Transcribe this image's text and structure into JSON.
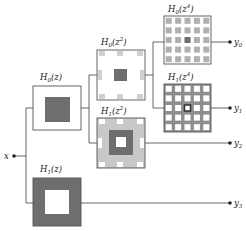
{
  "diagram": {
    "type": "wavelet packet filter bank tree",
    "input": {
      "label": "x"
    },
    "filters": [
      {
        "id": "h0z",
        "base": "H",
        "sub": "0",
        "arg": "z",
        "exp": "",
        "label": "H0(z)",
        "pattern": "white box, dark center square"
      },
      {
        "id": "h1z",
        "base": "H",
        "sub": "1",
        "arg": "z",
        "exp": "",
        "label": "H1(z)",
        "pattern": "dark box, white center square"
      },
      {
        "id": "h0z2",
        "base": "H",
        "sub": "0",
        "arg": "z",
        "exp": "2",
        "label": "H0(z^2)",
        "pattern": "white box, dark center, light gray edge tiles"
      },
      {
        "id": "h1z2",
        "base": "H",
        "sub": "1",
        "arg": "z",
        "exp": "2",
        "label": "H1(z^2)",
        "pattern": "light gray box, dark ring, white center"
      },
      {
        "id": "h0z4",
        "base": "H",
        "sub": "0",
        "arg": "z",
        "exp": "4",
        "label": "H0(z^4)",
        "pattern": "white box, grid of gray dots, dark center dot"
      },
      {
        "id": "h1z4",
        "base": "H",
        "sub": "1",
        "arg": "z",
        "exp": "4",
        "label": "H1(z^4)",
        "pattern": "gray box, grid of white holes, outlined center"
      }
    ],
    "outputs": [
      {
        "base": "y",
        "sub": "0",
        "label": "y0"
      },
      {
        "base": "y",
        "sub": "1",
        "label": "y1"
      },
      {
        "base": "y",
        "sub": "2",
        "label": "y2"
      },
      {
        "base": "y",
        "sub": "3",
        "label": "y3"
      }
    ],
    "colors": {
      "dark": "#6e6e6e",
      "mid": "#9a9a9a",
      "light": "#cfcfcf",
      "line": "#555555",
      "bg": "#ffffff"
    }
  }
}
